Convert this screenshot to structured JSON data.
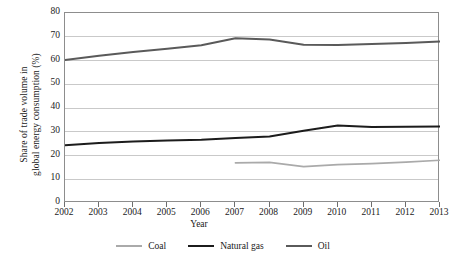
{
  "chart_data": {
    "type": "line",
    "title": "",
    "xlabel": "Year",
    "ylabel": "Share of trade volume in global energy consumption (%)",
    "ylabel_line1": "Share of trade volume in",
    "ylabel_line2": "global energy consumption  (%)",
    "categories": [
      "2002",
      "2003",
      "2004",
      "2005",
      "2006",
      "2007",
      "2008",
      "2009",
      "2010",
      "2011",
      "2012",
      "2013"
    ],
    "x": [
      2002,
      2003,
      2004,
      2005,
      2006,
      2007,
      2008,
      2009,
      2010,
      2011,
      2012,
      2013
    ],
    "xlim": [
      2002,
      2013
    ],
    "ylim": [
      0,
      80
    ],
    "yticks": [
      0,
      10,
      20,
      30,
      40,
      50,
      60,
      70,
      80
    ],
    "grid": true,
    "legend_position": "bottom",
    "series": [
      {
        "name": "Coal",
        "color": "#aaaaaa",
        "values": [
          null,
          null,
          null,
          null,
          null,
          16.9,
          17.1,
          15.3,
          16.2,
          16.6,
          17.2,
          18.0
        ]
      },
      {
        "name": "Natural gas",
        "color": "#1c1c1c",
        "values": [
          24.3,
          25.3,
          25.9,
          26.3,
          26.6,
          27.4,
          28.0,
          30.4,
          32.6,
          32.0,
          32.1,
          32.2
        ]
      },
      {
        "name": "Oil",
        "color": "#5a5a5a",
        "values": [
          60.2,
          62.0,
          63.6,
          65.0,
          66.4,
          69.4,
          68.8,
          66.6,
          66.5,
          66.9,
          67.4,
          68.0
        ]
      }
    ]
  },
  "axis": {
    "frame_color": "#8d8d8d",
    "grid_color": "#c9c9c9"
  }
}
